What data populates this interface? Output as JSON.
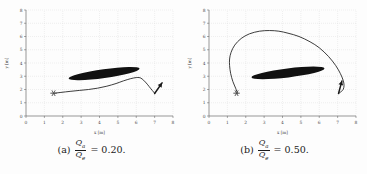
{
  "figure": {
    "subfigures": [
      {
        "tag": "(a)",
        "numerator": "Q",
        "numerator_sub": "a",
        "denominator": "Q",
        "denominator_sub": "e",
        "equals": "=",
        "value": "0.20.",
        "caption_full": "(a) Qa/Qe = 0.20."
      },
      {
        "tag": "(b)",
        "numerator": "Q",
        "numerator_sub": "a",
        "denominator": "Q",
        "denominator_sub": "e",
        "equals": "=",
        "value": "0.50.",
        "caption_full": "(b) Qa/Qe = 0.50."
      }
    ]
  },
  "chart_data": [
    {
      "type": "line",
      "title": "(a) Qa/Qe = 0.20",
      "xlabel": "x [m]",
      "ylabel": "y [m]",
      "xlim": [
        0,
        8
      ],
      "ylim": [
        0,
        8
      ],
      "xticks": [
        0,
        1,
        2,
        3,
        4,
        5,
        6,
        7,
        8
      ],
      "yticks": [
        0,
        1,
        2,
        3,
        4,
        5,
        6,
        7,
        8
      ],
      "grid": true,
      "legend": "none",
      "series": [
        {
          "name": "trajectory",
          "color": "#1a1a1a",
          "x": [
            1.55,
            1.9,
            2.4,
            2.9,
            3.4,
            3.9,
            4.4,
            4.9,
            5.3,
            5.7,
            6.0,
            6.15,
            6.25,
            6.4,
            6.6,
            6.8,
            6.95,
            7.0,
            7.0
          ],
          "y": [
            1.72,
            1.78,
            1.86,
            1.93,
            2.0,
            2.1,
            2.25,
            2.45,
            2.65,
            2.82,
            2.9,
            2.9,
            2.86,
            2.7,
            2.4,
            2.05,
            1.8,
            1.7,
            1.68
          ]
        }
      ],
      "markers": [
        {
          "name": "start-asterisk",
          "x": 1.5,
          "y": 1.72,
          "symbol": "asterisk",
          "color": "#4a4a4a"
        },
        {
          "name": "end-arrow",
          "x": 7.0,
          "y": 1.7,
          "symbol": "arrow",
          "angle_deg": 55,
          "color": "#1a1a1a"
        }
      ],
      "obstacles": [
        {
          "name": "ellipse-obstacle",
          "cx": 4.25,
          "cy": 3.2,
          "rx": 1.95,
          "ry": 0.33,
          "rotation_deg": -8,
          "fill": "#111111"
        }
      ]
    },
    {
      "type": "line",
      "title": "(b) Qa/Qe = 0.50",
      "xlabel": "x [m]",
      "ylabel": "y [m]",
      "xlim": [
        0,
        8
      ],
      "ylim": [
        0,
        8
      ],
      "xticks": [
        0,
        1,
        2,
        3,
        4,
        5,
        6,
        7,
        8
      ],
      "yticks": [
        0,
        1,
        2,
        3,
        4,
        5,
        6,
        7,
        8
      ],
      "grid": true,
      "legend": "none",
      "series": [
        {
          "name": "trajectory",
          "color": "#1a1a1a",
          "x": [
            1.55,
            1.45,
            1.3,
            1.18,
            1.12,
            1.12,
            1.2,
            1.4,
            1.75,
            2.2,
            2.75,
            3.3,
            3.8,
            4.3,
            4.9,
            5.5,
            6.0,
            6.5,
            6.9,
            7.15,
            7.3,
            7.35,
            7.3,
            7.2,
            7.1,
            7.05
          ],
          "y": [
            1.72,
            2.1,
            2.6,
            3.2,
            3.8,
            4.3,
            4.8,
            5.35,
            5.85,
            6.2,
            6.4,
            6.45,
            6.4,
            6.25,
            6.0,
            5.6,
            5.15,
            4.5,
            3.8,
            3.2,
            2.7,
            2.3,
            2.0,
            1.85,
            1.75,
            1.7
          ]
        }
      ],
      "markers": [
        {
          "name": "start-asterisk",
          "x": 1.5,
          "y": 1.72,
          "symbol": "asterisk",
          "color": "#4a4a4a"
        },
        {
          "name": "end-arrow",
          "x": 7.05,
          "y": 1.7,
          "symbol": "arrow",
          "angle_deg": 75,
          "color": "#1a1a1a"
        }
      ],
      "obstacles": [
        {
          "name": "ellipse-obstacle",
          "cx": 4.3,
          "cy": 3.25,
          "rx": 2.0,
          "ry": 0.34,
          "rotation_deg": -7,
          "fill": "#111111"
        }
      ]
    }
  ]
}
